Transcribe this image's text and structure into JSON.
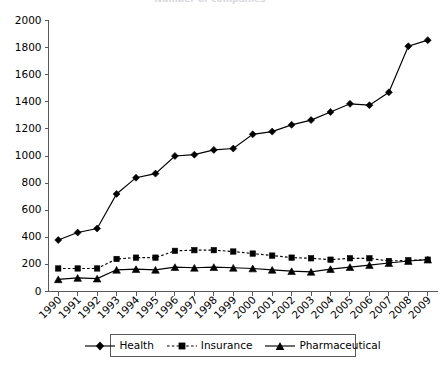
{
  "title": {
    "text": "Number of companies",
    "note": "cropped at top edge of screenshot"
  },
  "legend": {
    "position": "bottom-center",
    "entries": [
      {
        "label": "Health",
        "marker": "diamond",
        "line": "solid",
        "color": "#000000"
      },
      {
        "label": "Insurance",
        "marker": "square",
        "line": "dotted",
        "color": "#000000"
      },
      {
        "label": "Pharmaceutical",
        "marker": "triangle",
        "line": "solid",
        "color": "#000000"
      }
    ]
  },
  "axes": {
    "y": {
      "min": 0,
      "max": 2000,
      "step": 200,
      "ticks": [
        "0",
        "200",
        "400",
        "600",
        "800",
        "1000",
        "1200",
        "1400",
        "1600",
        "1800",
        "2000"
      ],
      "label": ""
    },
    "x": {
      "label": "",
      "tick_rotation_deg": 45,
      "ticks": [
        "1990",
        "1991",
        "1992",
        "1993",
        "1994",
        "1995",
        "1996",
        "1997",
        "1998",
        "1999",
        "2000",
        "2001",
        "2002",
        "2003",
        "2004",
        "2005",
        "2006",
        "2007",
        "2008",
        "2009"
      ]
    }
  },
  "chart_data": {
    "type": "line",
    "title": "Number of companies",
    "xlabel": "",
    "ylabel": "",
    "ylim": [
      0,
      2000
    ],
    "grid": false,
    "legend_position": "bottom",
    "categories": [
      "1990",
      "1991",
      "1992",
      "1993",
      "1994",
      "1995",
      "1996",
      "1997",
      "1998",
      "1999",
      "2000",
      "2001",
      "2002",
      "2003",
      "2004",
      "2005",
      "2006",
      "2007",
      "2008",
      "2009"
    ],
    "series": [
      {
        "name": "Health",
        "marker": "diamond",
        "linestyle": "solid",
        "color": "#000000",
        "values": [
          380,
          435,
          465,
          720,
          840,
          870,
          1000,
          1010,
          1045,
          1055,
          1160,
          1180,
          1230,
          1265,
          1325,
          1385,
          1375,
          1470,
          1810,
          1855
        ]
      },
      {
        "name": "Insurance",
        "marker": "square",
        "linestyle": "dotted",
        "color": "#000000",
        "values": [
          170,
          170,
          170,
          240,
          250,
          250,
          300,
          305,
          305,
          295,
          280,
          265,
          250,
          245,
          235,
          245,
          245,
          225,
          230,
          235
        ]
      },
      {
        "name": "Pharmaceutical",
        "marker": "triangle",
        "linestyle": "solid",
        "color": "#000000",
        "values": [
          90,
          100,
          95,
          160,
          165,
          160,
          180,
          175,
          180,
          175,
          170,
          160,
          150,
          145,
          165,
          180,
          195,
          210,
          225,
          235
        ]
      }
    ]
  },
  "colors": {
    "axis": "#595959",
    "series": "#000000",
    "background": "#ffffff"
  }
}
